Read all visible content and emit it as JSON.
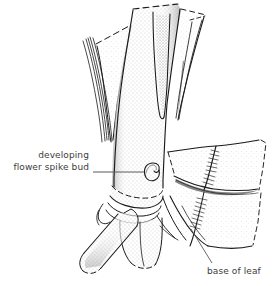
{
  "figure": {
    "kind": "botanical-line-illustration",
    "background_color": "#ffffff",
    "ink_color": "#1a1a1a",
    "stipple_color": "#4a4a4a",
    "leader_color": "#5a5a5a",
    "text_color": "#3c3c3c"
  },
  "labels": {
    "bud": {
      "line1": "developing",
      "line2": "flower spike bud"
    },
    "leaf": {
      "line1": "base of leaf"
    }
  },
  "callouts": [
    {
      "name": "developing-flower-spike-bud",
      "leader": "horizontal line from text to bud on stem"
    },
    {
      "name": "base-of-leaf",
      "leader": "diagonal line from text up-left to leaf base"
    }
  ]
}
